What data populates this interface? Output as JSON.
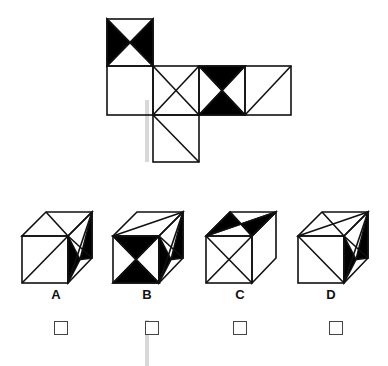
{
  "question": {
    "type": "cube-net-folding",
    "net": {
      "squares": [
        {
          "id": "top",
          "pattern": "hourglass-horizontal-black"
        },
        {
          "id": "row2-1",
          "pattern": "blank"
        },
        {
          "id": "row2-2",
          "pattern": "x-cross"
        },
        {
          "id": "row2-3",
          "pattern": "hourglass-vertical-black"
        },
        {
          "id": "row2-4",
          "pattern": "diagonal-bl-tr"
        },
        {
          "id": "bottom",
          "pattern": "diagonal-tl-br"
        }
      ]
    },
    "options": [
      {
        "label": "A",
        "checked": false
      },
      {
        "label": "B",
        "checked": false
      },
      {
        "label": "C",
        "checked": false
      },
      {
        "label": "D",
        "checked": false
      }
    ]
  },
  "colors": {
    "line": "#111111",
    "fill": "#000000",
    "background": "#ffffff",
    "scan_bar": "#d8d8d8"
  }
}
